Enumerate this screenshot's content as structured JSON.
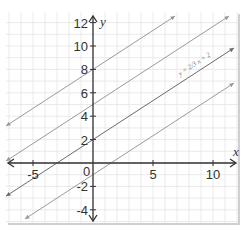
{
  "chart_data": {
    "type": "line",
    "title": "",
    "xlabel": "x",
    "ylabel": "y",
    "xlim": [
      -7,
      12
    ],
    "ylim": [
      -5,
      13
    ],
    "grid": true,
    "x_ticks": [
      -5,
      0,
      5,
      10
    ],
    "y_ticks": [
      -4,
      -2,
      2,
      4,
      6,
      8,
      10,
      12
    ],
    "x_tick_labels": [
      "-5",
      "0",
      "5",
      "10"
    ],
    "y_tick_labels": [
      "-4",
      "-2",
      "2",
      "4",
      "6",
      "8",
      "10",
      "12"
    ],
    "origin_label": "0",
    "annotation": "y = 2/3 x + 2",
    "series": [
      {
        "name": "y = 2/3x + 8",
        "slope": 0.6667,
        "intercept": 8,
        "color": "#9a9a9a"
      },
      {
        "name": "y = 2/3x + 5",
        "slope": 0.6667,
        "intercept": 5,
        "color": "#9a9a9a"
      },
      {
        "name": "y = 2/3x + 2",
        "slope": 0.6667,
        "intercept": 2,
        "color": "#6a6a6a"
      },
      {
        "name": "y = 2/3x - 1",
        "slope": 0.6667,
        "intercept": -1,
        "color": "#9a9a9a"
      }
    ]
  },
  "labels": {
    "x_axis": "x",
    "y_axis": "y",
    "origin": "0",
    "equation": "y = ²⁄₃ x + 2"
  },
  "colors": {
    "grid_minor": "#e4e4e4",
    "axis": "#333333",
    "frame_shadow": "#cfcfcf"
  }
}
